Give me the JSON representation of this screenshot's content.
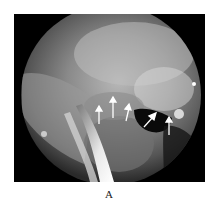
{
  "figure": {
    "panel_label": "A",
    "image_description": "Endoscopic view (circular field) with five white arrows indicating a lesion margin",
    "arrow_color": "#ffffff",
    "background_color": "#000000",
    "arrows": [
      {
        "id": 1,
        "direction": "up"
      },
      {
        "id": 2,
        "direction": "up"
      },
      {
        "id": 3,
        "direction": "up"
      },
      {
        "id": 4,
        "direction": "up-right"
      },
      {
        "id": 5,
        "direction": "up"
      }
    ]
  }
}
